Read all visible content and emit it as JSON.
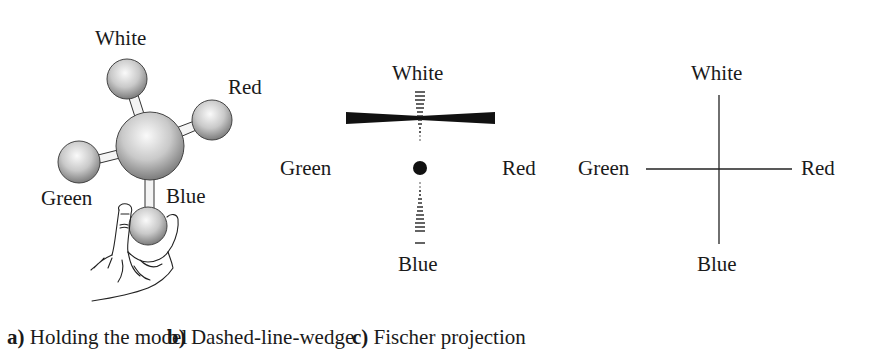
{
  "figure": {
    "panels": [
      {
        "id": "a",
        "letter": "a)",
        "caption": "Holding the model",
        "labels": {
          "top": "White",
          "right": "Red",
          "left": "Green",
          "bottom": "Blue"
        }
      },
      {
        "id": "b",
        "letter": "b)",
        "caption": "Dashed-line-wedge",
        "labels": {
          "top": "White",
          "right": "Red",
          "left": "Green",
          "bottom": "Blue"
        }
      },
      {
        "id": "c",
        "letter": "c)",
        "caption": "Fischer projection",
        "labels": {
          "top": "White",
          "right": "Red",
          "left": "Green",
          "bottom": "Blue"
        }
      }
    ]
  },
  "colors": {
    "ink": "#1a1a1a",
    "background": "#ffffff",
    "sphere_light": "#f4f4f4",
    "sphere_dark": "#8a8a8a"
  }
}
